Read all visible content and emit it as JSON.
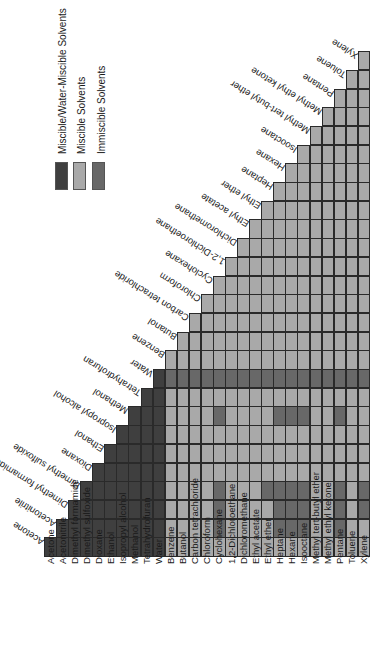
{
  "chart_data": {
    "type": "heatmap",
    "title": "",
    "solvents": [
      "Acetone",
      "Acetonitrile",
      "Dimethyl formamide",
      "Dimethyl sulfoxide",
      "Dioxane",
      "Ethanol",
      "Isopropyl alcohol",
      "Methanol",
      "Tetrahydrofuran",
      "Water",
      "Benzene",
      "Butanol",
      "Carbon tetrachloride",
      "Chloroform",
      "Cyclohexane",
      "1,2-Dichloroethane",
      "Dichloromethane",
      "Ethyl acetate",
      "Ethyl ether",
      "Heptane",
      "Hexane",
      "Isooctane",
      "Methyl tert-butyl ether",
      "Methyl ethyl ketone",
      "Pentane",
      "Toluene",
      "Xylene"
    ],
    "water_miscible_group_size": 10,
    "categories_legend": [
      {
        "key": "water_miscible",
        "label": "Miscible/Water-Miscible Solvents",
        "color": "#3f3f3f"
      },
      {
        "key": "miscible",
        "label": "Miscible Solvents",
        "color": "#a9a9a9"
      },
      {
        "key": "immiscible",
        "label": "Immiscible Solvents",
        "color": "#686868"
      }
    ],
    "immiscible_pairs": {
      "Acetonitrile": [
        "Cyclohexane",
        "Heptane",
        "Hexane",
        "Isooctane",
        "Pentane"
      ],
      "Dimethyl formamide": [
        "Cyclohexane",
        "Heptane",
        "Hexane",
        "Isooctane",
        "Pentane",
        "Xylene"
      ],
      "Dimethyl sulfoxide": [
        "Cyclohexane",
        "Ethyl ether",
        "Heptane",
        "Hexane",
        "Isooctane",
        "Pentane",
        "Xylene"
      ],
      "Methanol": [
        "Cyclohexane",
        "Heptane",
        "Hexane",
        "Isooctane",
        "Pentane"
      ],
      "Water": [
        "Benzene",
        "Butanol",
        "Carbon tetrachloride",
        "Chloroform",
        "Cyclohexane",
        "1,2-Dichloroethane",
        "Dichloromethane",
        "Ethyl acetate",
        "Ethyl ether",
        "Heptane",
        "Hexane",
        "Isooctane",
        "Methyl tert-butyl ether",
        "Methyl ethyl ketone",
        "Pentane",
        "Toluene",
        "Xylene"
      ]
    },
    "legend_position": "top-left",
    "grid": true,
    "orientation": "rotated 90 degrees"
  },
  "legend": {
    "items": [
      {
        "label": "Miscible/Water-Miscible Solvents"
      },
      {
        "label": "Miscible Solvents"
      },
      {
        "label": "Immiscible Solvents"
      }
    ]
  }
}
